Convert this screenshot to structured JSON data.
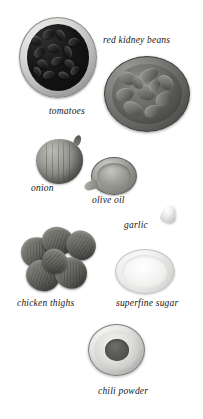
{
  "page": {
    "background_color": "#ffffff",
    "width": 203,
    "height": 419
  },
  "ingredients": [
    {
      "id": "red-kidney-beans",
      "label": "red kidney beans",
      "icon": "bowl-of-beans-icon",
      "label_position": {
        "left": 103,
        "top": 36
      },
      "font_size": 9.5
    },
    {
      "id": "tomatoes",
      "label": "tomatoes",
      "icon": "bowl-of-tomatoes-icon",
      "label_position": {
        "left": 49,
        "top": 107
      },
      "font_size": 9.5
    },
    {
      "id": "onion",
      "label": "onion",
      "icon": "onion-icon",
      "label_position": {
        "left": 31,
        "top": 184
      },
      "font_size": 9.5
    },
    {
      "id": "olive-oil",
      "label": "olive oil",
      "icon": "oil-dish-icon",
      "label_position": {
        "left": 92,
        "top": 196
      },
      "font_size": 9.5
    },
    {
      "id": "garlic",
      "label": "garlic",
      "icon": "garlic-clove-icon",
      "label_position": {
        "left": 124,
        "top": 221
      },
      "font_size": 9.5
    },
    {
      "id": "chicken-thighs",
      "label": "chicken thighs",
      "icon": "chicken-thighs-icon",
      "label_position": {
        "left": 17,
        "top": 299
      },
      "font_size": 9.5
    },
    {
      "id": "superfine-sugar",
      "label": "superfine sugar",
      "icon": "bowl-of-sugar-icon",
      "label_position": {
        "left": 116,
        "top": 299
      },
      "font_size": 9.5
    },
    {
      "id": "chili-powder",
      "label": "chili powder",
      "icon": "bowl-of-chili-powder-icon",
      "label_position": {
        "left": 98,
        "top": 387
      },
      "font_size": 9.5
    }
  ],
  "colors": {
    "background": "#ffffff",
    "label_text": "#161616",
    "beans_dark": "#0d0d0c",
    "tomatoes_mid": "#6d6d69",
    "onion_mid": "#9b9b96",
    "sugar_light": "#f4f4f3",
    "chili_fill": "#595955"
  }
}
